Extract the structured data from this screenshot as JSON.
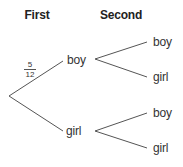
{
  "headers": {
    "first": "First",
    "second": "Second"
  },
  "tree": {
    "root": {
      "branches": [
        {
          "label": "boy",
          "probability": {
            "numerator": "5",
            "denominator": "12"
          },
          "children": [
            {
              "label": "boy"
            },
            {
              "label": "girl"
            }
          ]
        },
        {
          "label": "girl",
          "children": [
            {
              "label": "boy"
            },
            {
              "label": "girl"
            }
          ]
        }
      ]
    }
  },
  "colors": {
    "line": "#555555",
    "text": "#333333",
    "background": "#ffffff"
  }
}
